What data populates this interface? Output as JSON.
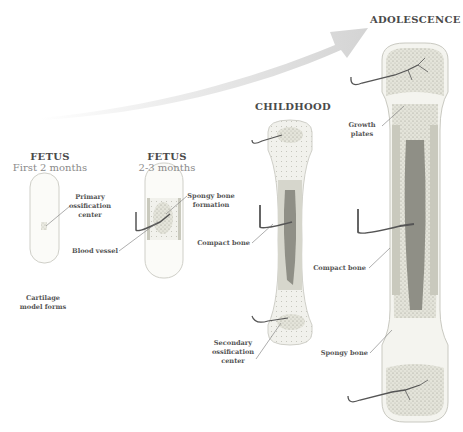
{
  "diagram": {
    "type": "bone-development-stages",
    "arrow": {
      "direction": "growth-over-time",
      "color": "#d9d9d9"
    },
    "stages": [
      {
        "id": "fetus-early",
        "title": "FETUS",
        "subtitle": "First 2 months",
        "labels": [
          "Primary ossification center",
          "Cartilage model forms"
        ]
      },
      {
        "id": "fetus-late",
        "title": "FETUS",
        "subtitle": "2-3 months",
        "labels": [
          "Spongy bone formation",
          "Blood vessel"
        ]
      },
      {
        "id": "childhood",
        "title": "CHILDHOOD",
        "labels": [
          "Compact bone",
          "Secondary ossification center"
        ]
      },
      {
        "id": "adolescence",
        "title": "ADOLESCENCE",
        "labels": [
          "Growth plates",
          "Compact bone",
          "Spongy bone"
        ]
      }
    ],
    "label_text": {
      "primary_ossification": [
        "Primary",
        "ossification",
        "center"
      ],
      "cartilage": [
        "Cartilage",
        "model forms"
      ],
      "blood_vessel": "Blood vessel",
      "spongy_formation": [
        "Spongy bone",
        "formation"
      ],
      "compact_child": "Compact bone",
      "secondary_ossification": [
        "Secondary",
        "ossification",
        "center"
      ],
      "growth_plates": [
        "Growth",
        "plates"
      ],
      "compact_adol": "Compact bone",
      "spongy_adol": "Spongy bone"
    },
    "colors": {
      "cartilage": "#fbfbf8",
      "spongy": "#e6e6dd",
      "compact": "#c9c9bd",
      "marrow": "#8f8f86",
      "vessel": "#555555",
      "title": "#4a4a4a",
      "subtitle": "#8a8a8a"
    }
  }
}
